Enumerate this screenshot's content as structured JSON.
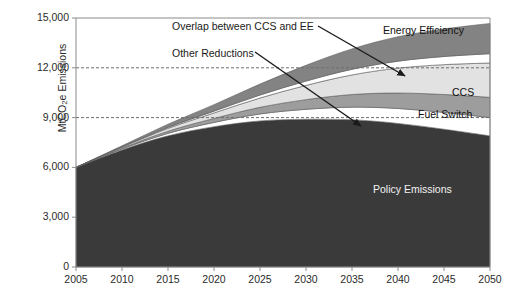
{
  "chart_data": {
    "type": "area",
    "title": "",
    "xlabel": "",
    "ylabel": "MtCO2e Emissions",
    "ylabel_prefix": "MtCO",
    "ylabel_sub": "2",
    "ylabel_suffix": "e Emissions",
    "xlim": [
      2005,
      2050
    ],
    "ylim": [
      0,
      15000
    ],
    "xticks": [
      "2005",
      "2010",
      "2015",
      "2020",
      "2025",
      "2030",
      "2035",
      "2040",
      "2045",
      "2050"
    ],
    "xtick_values": [
      2005,
      2010,
      2015,
      2020,
      2025,
      2030,
      2035,
      2040,
      2045,
      2050
    ],
    "yticks": [
      "0",
      "3,000",
      "6,000",
      "9,000",
      "12,000",
      "15,000"
    ],
    "ytick_values": [
      0,
      3000,
      6000,
      9000,
      12000,
      15000
    ],
    "gridlines": [
      9000,
      12000
    ],
    "grid": "dashed horizontal gridlines at 9,000 and 12,000 only",
    "legend": "in-plot direct labels and leader-line annotations",
    "x": [
      2005,
      2010,
      2015,
      2020,
      2025,
      2030,
      2035,
      2040,
      2045,
      2050
    ],
    "series": [
      {
        "name": "Policy Emissions",
        "color": "#3a3a3a",
        "values": [
          6000,
          7050,
          7900,
          8450,
          8800,
          8900,
          8870,
          8650,
          8300,
          7900
        ]
      },
      {
        "name": "Other Reductions",
        "color": "#ffffff",
        "values": [
          0,
          60,
          150,
          260,
          420,
          600,
          760,
          900,
          1010,
          1100
        ]
      },
      {
        "name": "Fuel Switch",
        "color": "#9d9d9d",
        "values": [
          0,
          50,
          130,
          240,
          400,
          580,
          760,
          930,
          1080,
          1220
        ]
      },
      {
        "name": "CCS",
        "color": "#e2e2e2",
        "values": [
          0,
          60,
          170,
          330,
          560,
          860,
          1180,
          1500,
          1800,
          2070
        ]
      },
      {
        "name": "Overlap between CCS and EE",
        "color": "#ffffff",
        "values": [
          0,
          20,
          60,
          110,
          180,
          260,
          340,
          420,
          490,
          560
        ]
      },
      {
        "name": "Energy Efficiency",
        "color": "#838383",
        "values": [
          0,
          60,
          190,
          390,
          660,
          950,
          1230,
          1470,
          1660,
          1820
        ]
      }
    ],
    "total_top": [
      6000,
      7300,
      8600,
      9780,
      11020,
      12150,
      13140,
      13870,
      14340,
      14670
    ],
    "annotations": [
      {
        "name": "Overlap between CCS and EE",
        "text": "Overlap between CCS and EE"
      },
      {
        "name": "Other Reductions",
        "text": "Other Reductions"
      },
      {
        "name": "Energy Efficiency",
        "text": "Energy Efficiency"
      },
      {
        "name": "CCS",
        "text": "CCS"
      },
      {
        "name": "Fuel Switch",
        "text": "Fuel Switch"
      },
      {
        "name": "Policy Emissions",
        "text": "Policy Emissions"
      }
    ]
  },
  "labels": {
    "overlap": "Overlap between CCS and EE",
    "other_reductions": "Other Reductions",
    "energy_efficiency": "Energy Efficiency",
    "ccs": "CCS",
    "fuel_switch": "Fuel Switch",
    "policy_emissions": "Policy Emissions"
  },
  "axis": {
    "y_label_prefix": "MtCO",
    "y_label_sub": "2",
    "y_label_suffix": "e Emissions",
    "y_ticks": [
      "15,000",
      "12,000",
      "9,000",
      "6,000",
      "3,000",
      "0"
    ],
    "x_ticks": [
      "2005",
      "2010",
      "2015",
      "2020",
      "2025",
      "2030",
      "2035",
      "2040",
      "2045",
      "2050"
    ]
  },
  "colors": {
    "policy_emissions": "#3a3a3a",
    "energy_efficiency": "#838383",
    "ccs": "#e2e2e2",
    "fuel_switch": "#9d9d9d",
    "overlap": "#ffffff",
    "other_reductions": "#ffffff",
    "axis": "#8a8a8a",
    "grid": "#6e6e6e",
    "text": "#1a1a1a"
  }
}
